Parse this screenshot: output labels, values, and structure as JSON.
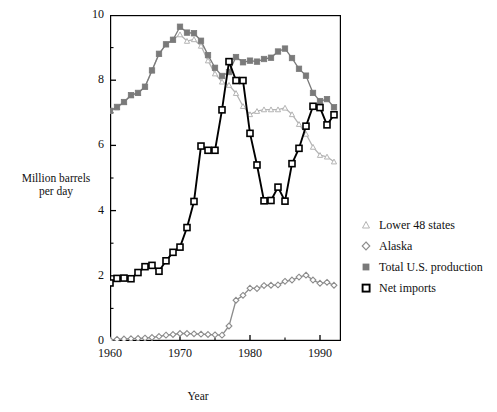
{
  "chart_data": {
    "type": "line",
    "title": "",
    "xlabel": "Year",
    "ylabel": "Million barrels per day",
    "xlim": [
      1960,
      1993
    ],
    "ylim": [
      0,
      10
    ],
    "xticks": [
      1960,
      1970,
      1980,
      1990
    ],
    "xtick_labels": [
      "1960",
      "1970",
      "1980",
      "1990"
    ],
    "x_minor_ticks": [
      1965,
      1975,
      1985
    ],
    "yticks": [
      0,
      2,
      4,
      6,
      8,
      10
    ],
    "ytick_labels": [
      "0",
      "2",
      "4",
      "6",
      "8",
      "10"
    ],
    "y_minor_ticks": [
      1,
      3,
      5,
      7,
      9
    ],
    "grid": false,
    "legend_position": "right",
    "x": [
      1960,
      1961,
      1962,
      1963,
      1964,
      1965,
      1966,
      1967,
      1968,
      1969,
      1970,
      1971,
      1972,
      1973,
      1974,
      1975,
      1976,
      1977,
      1978,
      1979,
      1980,
      1981,
      1982,
      1983,
      1984,
      1985,
      1986,
      1987,
      1988,
      1989,
      1990,
      1991,
      1992
    ],
    "series": [
      {
        "name": "Lower 48 states",
        "marker": "triangle-open",
        "color": "#b4b4b4",
        "values": [
          7.05,
          7.15,
          7.33,
          7.54,
          7.6,
          7.8,
          8.3,
          8.8,
          9.1,
          9.25,
          9.4,
          9.2,
          9.25,
          9.05,
          8.6,
          8.2,
          7.95,
          7.85,
          7.6,
          7.2,
          6.95,
          7.05,
          7.1,
          7.1,
          7.1,
          7.15,
          6.95,
          6.65,
          6.35,
          5.95,
          5.7,
          5.65,
          5.5
        ]
      },
      {
        "name": "Alaska",
        "marker": "diamond-open",
        "color": "#8c8c8c",
        "values": [
          0.03,
          0.05,
          0.06,
          0.07,
          0.08,
          0.09,
          0.11,
          0.14,
          0.18,
          0.2,
          0.23,
          0.23,
          0.22,
          0.21,
          0.2,
          0.19,
          0.18,
          0.46,
          1.25,
          1.4,
          1.62,
          1.61,
          1.7,
          1.71,
          1.72,
          1.83,
          1.87,
          1.96,
          2.02,
          1.87,
          1.77,
          1.8,
          1.71
        ]
      },
      {
        "name": "Total U.S. production",
        "marker": "square-filled",
        "color": "#7a7a7a",
        "values": [
          7.06,
          7.18,
          7.33,
          7.54,
          7.61,
          7.8,
          8.3,
          8.81,
          9.1,
          9.24,
          9.64,
          9.46,
          9.44,
          9.21,
          8.77,
          8.38,
          8.13,
          8.25,
          8.71,
          8.55,
          8.6,
          8.57,
          8.65,
          8.69,
          8.88,
          8.97,
          8.68,
          8.35,
          8.14,
          7.61,
          7.36,
          7.42,
          7.17
        ]
      },
      {
        "name": "Net imports",
        "marker": "square-open",
        "color": "#000000",
        "values": [
          1.78,
          1.92,
          1.93,
          1.91,
          2.1,
          2.28,
          2.32,
          2.14,
          2.46,
          2.72,
          2.88,
          3.48,
          4.28,
          5.98,
          5.85,
          5.85,
          7.09,
          8.57,
          7.99,
          7.99,
          6.37,
          5.4,
          4.3,
          4.31,
          4.72,
          4.29,
          5.44,
          5.91,
          6.59,
          7.2,
          7.16,
          6.63,
          6.94
        ]
      }
    ]
  },
  "axis": {
    "y_title": "Million barrels\nper day",
    "y_title_line1": "Million barrels",
    "y_title_line2": "per day",
    "x_title": "Year"
  },
  "legend": {
    "items": [
      {
        "label": "Lower 48 states",
        "marker": "triangle-open-icon"
      },
      {
        "label": "Alaska",
        "marker": "diamond-open-icon"
      },
      {
        "label": "Total U.S. production",
        "marker": "square-filled-icon"
      },
      {
        "label": "Net imports",
        "marker": "square-open-icon"
      }
    ]
  },
  "colors": {
    "lower48": "#b4b4b4",
    "alaska": "#8c8c8c",
    "total": "#7a7a7a",
    "net_imports": "#000000",
    "frame": "#000000"
  }
}
